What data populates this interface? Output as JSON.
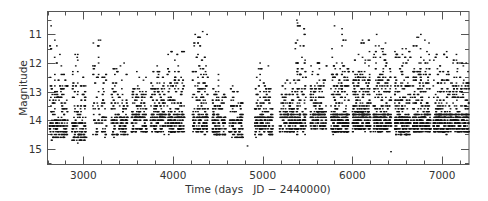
{
  "chart_data": {
    "type": "scatter",
    "title": "",
    "xlabel": "Time (days   JD − 2440000)",
    "ylabel": "Magnitude",
    "xlim": [
      2600,
      7300
    ],
    "ylim": [
      15.55,
      10.2
    ],
    "y_inverted": true,
    "grid": false,
    "legend": null,
    "x_ticks": [
      3000,
      4000,
      5000,
      6000,
      7000
    ],
    "x_minor_step": 200,
    "y_ticks": [
      11,
      12,
      13,
      14,
      15
    ],
    "y_minor_step": 0.5,
    "marker": "small dot",
    "marker_color": "#111111",
    "seasons": [
      {
        "center": 2720,
        "width": 200,
        "base": 14.2,
        "min_mag": 11.2,
        "n": 170
      },
      {
        "center": 2950,
        "width": 160,
        "base": 14.3,
        "min_mag": 11.7,
        "n": 130
      },
      {
        "center": 3180,
        "width": 150,
        "base": 14.1,
        "min_mag": 11.2,
        "n": 70
      },
      {
        "center": 3400,
        "width": 180,
        "base": 14.1,
        "min_mag": 12.0,
        "n": 140
      },
      {
        "center": 3620,
        "width": 170,
        "base": 14.0,
        "min_mag": 12.3,
        "n": 150
      },
      {
        "center": 3830,
        "width": 170,
        "base": 14.0,
        "min_mag": 12.1,
        "n": 150
      },
      {
        "center": 4030,
        "width": 190,
        "base": 14.0,
        "min_mag": 11.5,
        "n": 190
      },
      {
        "center": 4300,
        "width": 170,
        "base": 14.0,
        "min_mag": 10.9,
        "n": 170
      },
      {
        "center": 4510,
        "width": 150,
        "base": 14.1,
        "min_mag": 12.4,
        "n": 130
      },
      {
        "center": 4700,
        "width": 150,
        "base": 14.2,
        "min_mag": 12.8,
        "n": 110
      },
      {
        "center": 5010,
        "width": 200,
        "base": 14.1,
        "min_mag": 12.0,
        "n": 170
      },
      {
        "center": 5270,
        "width": 170,
        "base": 14.0,
        "min_mag": 12.5,
        "n": 140
      },
      {
        "center": 5420,
        "width": 120,
        "base": 14.0,
        "min_mag": 10.6,
        "n": 130
      },
      {
        "center": 5620,
        "width": 180,
        "base": 13.9,
        "min_mag": 12.0,
        "n": 170
      },
      {
        "center": 5860,
        "width": 200,
        "base": 14.0,
        "min_mag": 10.8,
        "n": 260
      },
      {
        "center": 6100,
        "width": 200,
        "base": 13.9,
        "min_mag": 11.2,
        "n": 280
      },
      {
        "center": 6330,
        "width": 200,
        "base": 14.0,
        "min_mag": 11.3,
        "n": 260
      },
      {
        "center": 6560,
        "width": 180,
        "base": 14.1,
        "min_mag": 11.5,
        "n": 240
      },
      {
        "center": 6770,
        "width": 200,
        "base": 14.0,
        "min_mag": 11.0,
        "n": 250
      },
      {
        "center": 7000,
        "width": 200,
        "base": 14.0,
        "min_mag": 11.6,
        "n": 240
      },
      {
        "center": 7200,
        "width": 190,
        "base": 14.0,
        "min_mag": 11.7,
        "n": 220
      }
    ],
    "notable_points": [
      {
        "x": 2640,
        "y": 10.7
      },
      {
        "x": 3190,
        "y": 11.2
      },
      {
        "x": 4330,
        "y": 10.9
      },
      {
        "x": 5380,
        "y": 10.5
      },
      {
        "x": 5800,
        "y": 10.7
      },
      {
        "x": 6270,
        "y": 11.0
      },
      {
        "x": 6720,
        "y": 11.1
      },
      {
        "x": 4830,
        "y": 14.9
      },
      {
        "x": 6430,
        "y": 15.1
      }
    ]
  }
}
